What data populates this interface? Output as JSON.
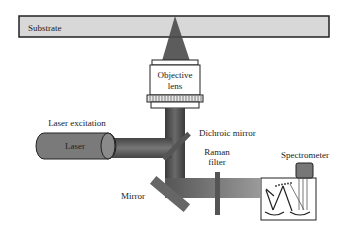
{
  "diagram": {
    "type": "Raman microscope schematic",
    "labels": {
      "substrate": "Substrate",
      "objective_line1": "Objective",
      "objective_line2": "lens",
      "laser_excitation": "Laser excitation",
      "laser": "Laser",
      "dichroic_mirror": "Dichroic mirror",
      "raman_filter_line1": "Raman",
      "raman_filter_line2": "filter",
      "spectrometer": "Spectrometer",
      "mirror": "Mirror"
    },
    "colors": {
      "beam": "#555555",
      "substrate_fill": "#d8d8d8",
      "outline": "#222222",
      "laser_body": "#7a7a7a",
      "mirror": "#666666"
    }
  }
}
